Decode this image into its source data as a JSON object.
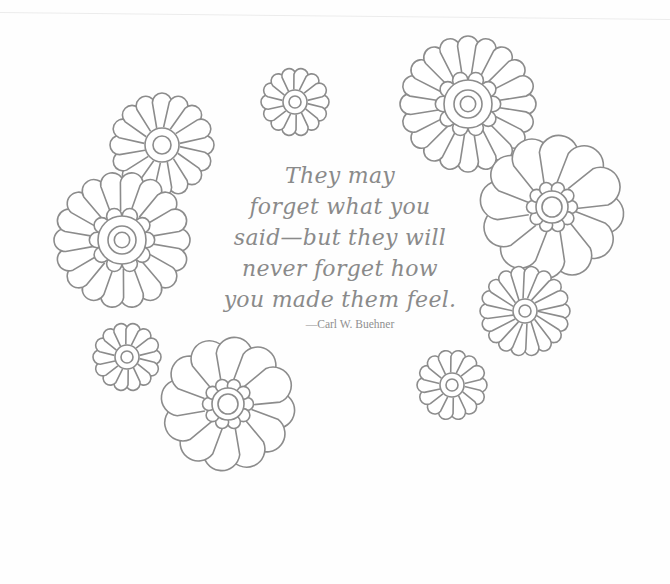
{
  "quote": {
    "lines": [
      "They may",
      "forget what you",
      "said—but they will",
      "never forget how",
      "you made them feel."
    ],
    "attribution": "—Carl W. Buehner"
  },
  "colors": {
    "line": "#8c8c8c",
    "text": "#8a8a8a",
    "background": "#fefefe"
  },
  "flowers": [
    {
      "name": "daisy-top-left",
      "cx": 162,
      "cy": 145,
      "r": 52,
      "petals": 16,
      "style": "thin",
      "center_r": 17,
      "inner_r": 9
    },
    {
      "name": "scalloped-left",
      "cx": 122,
      "cy": 240,
      "r": 68,
      "petals": 18,
      "style": "scalloped",
      "center_r": 24,
      "inner_r": 14
    },
    {
      "name": "small-top-center",
      "cx": 295,
      "cy": 102,
      "r": 34,
      "petals": 14,
      "style": "thin",
      "center_r": 12,
      "inner_r": 6
    },
    {
      "name": "scalloped-top-right",
      "cx": 468,
      "cy": 104,
      "r": 68,
      "petals": 20,
      "style": "scalloped",
      "center_r": 24,
      "inner_r": 14
    },
    {
      "name": "broad-right",
      "cx": 552,
      "cy": 207,
      "r": 72,
      "petals": 12,
      "style": "broad",
      "center_r": 16,
      "inner_r": 10
    },
    {
      "name": "daisy-right",
      "cx": 525,
      "cy": 311,
      "r": 45,
      "petals": 18,
      "style": "thin",
      "center_r": 12,
      "inner_r": 6
    },
    {
      "name": "small-bottom-left",
      "cx": 127,
      "cy": 357,
      "r": 34,
      "petals": 14,
      "style": "thin",
      "center_r": 12,
      "inner_r": 6
    },
    {
      "name": "broad-bottom-center",
      "cx": 228,
      "cy": 404,
      "r": 67,
      "petals": 12,
      "style": "broad",
      "center_r": 16,
      "inner_r": 10
    },
    {
      "name": "small-bottom-right",
      "cx": 452,
      "cy": 385,
      "r": 35,
      "petals": 14,
      "style": "thin",
      "center_r": 12,
      "inner_r": 6
    }
  ]
}
